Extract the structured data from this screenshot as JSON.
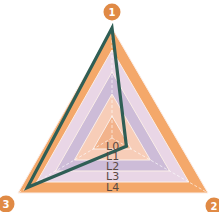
{
  "chart_data": {
    "type": "radar",
    "title": "",
    "axes": [
      "1",
      "2",
      "3"
    ],
    "levels": [
      "L0",
      "L1",
      "L2",
      "L3",
      "L4"
    ],
    "level_colors": [
      "#f2b38c",
      "#f7cdb8",
      "#cdbcd8",
      "#e9d6e6",
      "#f4a86a"
    ],
    "series": [
      {
        "name": "series",
        "values": [
          4,
          0.6,
          3.6
        ],
        "color": "#2f5e55"
      }
    ],
    "range": [
      0,
      4
    ],
    "grid": true,
    "legend": "none"
  },
  "axis_badges": [
    {
      "label": "1",
      "color": "#e08a45"
    },
    {
      "label": "2",
      "color": "#e08a45"
    },
    {
      "label": "3",
      "color": "#e08a45"
    }
  ],
  "level_labels": [
    "L0",
    "L1",
    "L2",
    "L3",
    "L4"
  ]
}
